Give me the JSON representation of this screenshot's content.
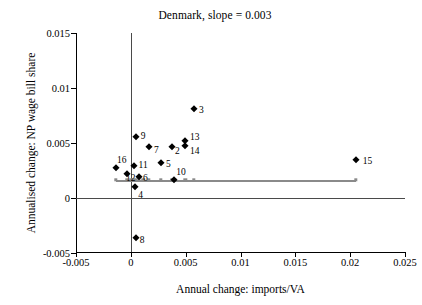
{
  "chart_data": {
    "type": "scatter",
    "title": "Denmark, slope = 0.003",
    "xlabel": "Annual change: imports/VA",
    "ylabel": "Annualised change: NP wage bill share",
    "xlim": [
      -0.005,
      0.025
    ],
    "ylim": [
      -0.005,
      0.015
    ],
    "xticks": [
      "-0.005",
      "0",
      "0.005",
      "0.01",
      "0.015",
      "0.02",
      "0.025"
    ],
    "xtick_values": [
      -0.005,
      0,
      0.005,
      0.01,
      0.015,
      0.02,
      0.025
    ],
    "yticks": [
      "0.015",
      "0.01",
      "0.005",
      "0",
      "-0.005"
    ],
    "ytick_values": [
      0.015,
      0.01,
      0.005,
      0,
      -0.005
    ],
    "grid": false,
    "legend": null,
    "slope": 0.003,
    "reference_lines": [
      {
        "name": "vertical-zero",
        "orientation": "vertical",
        "value": 0
      },
      {
        "name": "horizontal-zero",
        "orientation": "horizontal",
        "value": 0
      }
    ],
    "fit_line": {
      "name": "fitted-regression-line",
      "y": 0.00163,
      "x_start": -0.00135,
      "x_end": 0.0205,
      "color": "#8a8a8a",
      "marker_x": [
        -0.00135,
        -0.00035,
        5e-05,
        0.00025,
        0.00045,
        0.00075,
        0.00115,
        0.00165,
        0.00275,
        0.00375,
        0.00395,
        0.00495,
        0.00575,
        0.0205
      ]
    },
    "point_color": "#000000",
    "points": [
      {
        "label": "2",
        "x": 0.00375,
        "y": 0.00465
      },
      {
        "label": "3",
        "x": 0.00575,
        "y": 0.0081
      },
      {
        "label": "4",
        "x": 0.0004,
        "y": 0.001
      },
      {
        "label": "5",
        "x": 0.00275,
        "y": 0.00315
      },
      {
        "label": "6",
        "x": 0.00075,
        "y": 0.0019
      },
      {
        "label": "7",
        "x": 0.00165,
        "y": 0.00465
      },
      {
        "label": "8",
        "x": 0.00045,
        "y": -0.00365
      },
      {
        "label": "9",
        "x": 0.00045,
        "y": 0.00555
      },
      {
        "label": "10",
        "x": 0.00395,
        "y": 0.00165
      },
      {
        "label": "11",
        "x": 0.00025,
        "y": 0.0029
      },
      {
        "label": "12",
        "x": -0.00035,
        "y": 0.00215
      },
      {
        "label": "13",
        "x": 0.00495,
        "y": 0.00515
      },
      {
        "label": "14",
        "x": 0.00495,
        "y": 0.0047
      },
      {
        "label": "15",
        "x": 0.0205,
        "y": 0.00345
      },
      {
        "label": "16",
        "x": -0.00135,
        "y": 0.00275
      }
    ],
    "label_offsets": {
      "2": {
        "dx": 3,
        "dy": 5
      },
      "3": {
        "dx": 5,
        "dy": 2
      },
      "4": {
        "dx": 3,
        "dy": 9
      },
      "5": {
        "dx": 5,
        "dy": 2
      },
      "6": {
        "dx": 4,
        "dy": 2
      },
      "7": {
        "dx": 5,
        "dy": 4
      },
      "8": {
        "dx": 4,
        "dy": 3
      },
      "9": {
        "dx": 5,
        "dy": 0
      },
      "10": {
        "dx": 2,
        "dy": -7
      },
      "11": {
        "dx": 5,
        "dy": 0
      },
      "12": {
        "dx": -1,
        "dy": 5
      },
      "13": {
        "dx": 5,
        "dy": -3
      },
      "14": {
        "dx": 5,
        "dy": 6
      },
      "15": {
        "dx": 7,
        "dy": 2
      },
      "16": {
        "dx": 1,
        "dy": -7
      }
    }
  }
}
